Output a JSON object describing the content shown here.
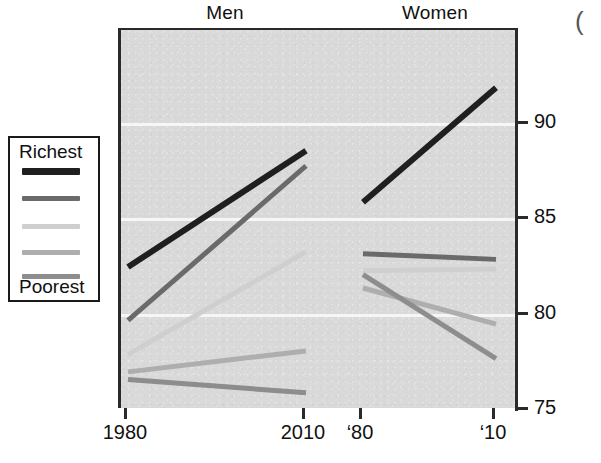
{
  "figure": {
    "panels": [
      {
        "key": "men",
        "label": "Men"
      },
      {
        "key": "women",
        "label": "Women"
      }
    ],
    "corner_mark": "("
  },
  "legend": {
    "top_label": "Richest",
    "bottom_label": "Poorest",
    "swatches": [
      {
        "name": "richest-quintile",
        "color": "#1f1f1f"
      },
      {
        "name": "second-quintile",
        "color": "#6a6a6a"
      },
      {
        "name": "middle-quintile",
        "color": "#cfcfcf"
      },
      {
        "name": "fourth-quintile",
        "color": "#aeaeae"
      },
      {
        "name": "poorest-quintile",
        "color": "#8d8d8d"
      }
    ]
  },
  "axes": {
    "y": {
      "ticks": [
        90,
        85,
        80,
        75
      ],
      "tick_labels": [
        "90",
        "85",
        "80",
        "75"
      ],
      "min": 75,
      "max": 94.9,
      "gridlines": [
        90,
        85,
        80
      ],
      "position": "right"
    },
    "x": {
      "tick_labels": [
        "1980",
        "2010",
        "‘80",
        "‘10"
      ],
      "tick_values": [
        1980,
        2010,
        1980,
        2010
      ]
    }
  },
  "chart_data": {
    "type": "line",
    "title": "",
    "subtitle": "",
    "xlabel": "",
    "ylabel": "",
    "ylim": [
      75,
      94.9
    ],
    "grid": true,
    "legend_position": "left-outside",
    "panels": [
      "Men",
      "Women"
    ],
    "x": [
      1980,
      2010
    ],
    "series": [
      {
        "name": "Richest",
        "color": "#1f1f1f",
        "men": [
          82.5,
          88.6
        ],
        "women": [
          85.9,
          91.9
        ]
      },
      {
        "name": "Second",
        "color": "#6a6a6a",
        "men": [
          79.7,
          87.8
        ],
        "women": [
          83.2,
          82.9
        ]
      },
      {
        "name": "Middle",
        "color": "#cfcfcf",
        "men": [
          77.9,
          83.3
        ],
        "women": [
          82.3,
          82.4
        ]
      },
      {
        "name": "Fourth",
        "color": "#aeaeae",
        "men": [
          77.0,
          78.1
        ],
        "women": [
          81.4,
          79.5
        ]
      },
      {
        "name": "Poorest",
        "color": "#8d8d8d",
        "men": [
          76.6,
          75.9
        ],
        "women": [
          82.1,
          77.7
        ]
      }
    ]
  }
}
